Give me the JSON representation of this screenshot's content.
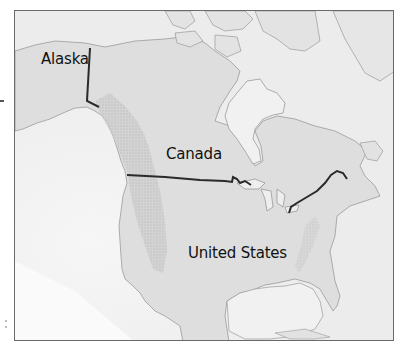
{
  "map": {
    "labels": {
      "alaska": "Alaska",
      "canada": "Canada",
      "united_states": "United States"
    },
    "colors": {
      "land": "#dcdcdc",
      "water": "#f3f3f3",
      "mountains": "#c4c4c4",
      "coastline": "#9a9a9a",
      "border": "#2a2a2a",
      "frame": "#6a6a6a"
    }
  }
}
